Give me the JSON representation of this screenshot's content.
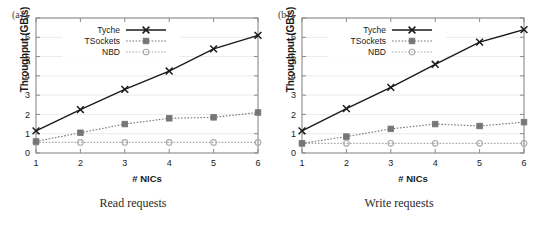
{
  "figure": {
    "background": "#ffffff",
    "panels": [
      {
        "key": "a",
        "tag": "(a)",
        "caption": "Read requests"
      },
      {
        "key": "b",
        "tag": "(b)",
        "caption": "Write requests"
      }
    ]
  },
  "chart_data": [
    {
      "type": "line",
      "panel": "(a)",
      "title": "Read requests",
      "xlabel": "# NICs",
      "ylabel": "Throughput (GB/s)",
      "x": [
        1,
        2,
        3,
        4,
        5,
        6
      ],
      "xticklabels": [
        "1",
        "2",
        "3",
        "4",
        "5",
        "6"
      ],
      "yticklabels": [
        "0",
        "1",
        "2",
        "3",
        "4",
        "5",
        "6",
        "7"
      ],
      "xlim": [
        1,
        6
      ],
      "ylim": [
        0,
        7
      ],
      "grid": "horizontal",
      "legend_position": "top-center",
      "series": [
        {
          "name": "Tyche",
          "values": [
            1.15,
            2.25,
            3.3,
            4.25,
            5.4,
            6.1
          ],
          "color": "#1a1a1a",
          "marker": "x",
          "linestyle": "solid"
        },
        {
          "name": "TSockets",
          "values": [
            0.6,
            1.05,
            1.5,
            1.8,
            1.85,
            2.1
          ],
          "color": "#767676",
          "marker": "square",
          "linestyle": "dotted"
        },
        {
          "name": "NBD",
          "values": [
            0.55,
            0.55,
            0.55,
            0.55,
            0.55,
            0.55
          ],
          "color": "#a8a8a8",
          "marker": "circle",
          "linestyle": "dotted"
        }
      ]
    },
    {
      "type": "line",
      "panel": "(b)",
      "title": "Write requests",
      "xlabel": "# NICs",
      "ylabel": "Throughput (GB/s)",
      "x": [
        1,
        2,
        3,
        4,
        5,
        6
      ],
      "xticklabels": [
        "1",
        "2",
        "3",
        "4",
        "5",
        "6"
      ],
      "yticklabels": [
        "0",
        "1",
        "2",
        "3",
        "4",
        "5",
        "6",
        "7"
      ],
      "xlim": [
        1,
        6
      ],
      "ylim": [
        0,
        7
      ],
      "grid": "horizontal",
      "legend_position": "top-center",
      "series": [
        {
          "name": "Tyche",
          "values": [
            1.15,
            2.3,
            3.4,
            4.6,
            5.75,
            6.4
          ],
          "color": "#1a1a1a",
          "marker": "x",
          "linestyle": "solid"
        },
        {
          "name": "TSockets",
          "values": [
            0.5,
            0.85,
            1.25,
            1.5,
            1.4,
            1.6
          ],
          "color": "#767676",
          "marker": "square",
          "linestyle": "dotted"
        },
        {
          "name": "NBD",
          "values": [
            0.5,
            0.5,
            0.5,
            0.5,
            0.5,
            0.5
          ],
          "color": "#a8a8a8",
          "marker": "circle",
          "linestyle": "dotted"
        }
      ]
    }
  ]
}
